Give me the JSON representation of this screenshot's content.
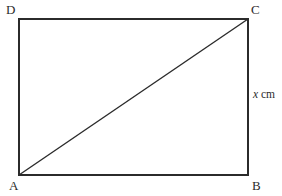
{
  "figure": {
    "type": "geometry-diagram",
    "shape": "rectangle-with-diagonal",
    "background_color": "#ffffff",
    "stroke_color": "#2b2b2b",
    "stroke_width": 1.4,
    "width": 282,
    "height": 196,
    "rectangle": {
      "left": 19,
      "top": 19,
      "right": 248,
      "bottom": 175
    },
    "diagonal": {
      "from": "A",
      "to": "C",
      "x1": 19,
      "y1": 175,
      "x2": 248,
      "y2": 19
    },
    "vertices": [
      {
        "id": "D",
        "label": "D",
        "position": "top-left"
      },
      {
        "id": "C",
        "label": "C",
        "position": "top-right"
      },
      {
        "id": "A",
        "label": "A",
        "position": "bottom-left"
      },
      {
        "id": "B",
        "label": "B",
        "position": "bottom-right"
      }
    ],
    "side_labels": [
      {
        "id": "BC",
        "variable": "x",
        "unit": "cm",
        "side": "right"
      }
    ]
  }
}
